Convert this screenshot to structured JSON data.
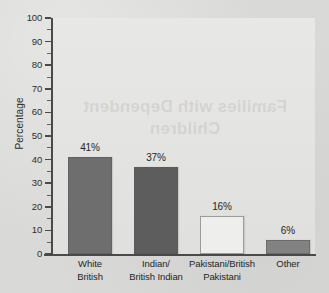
{
  "chart_data": {
    "type": "bar",
    "title": "",
    "subtitle": "",
    "xlabel": "",
    "ylabel": "Percentage",
    "ylim": [
      0,
      100
    ],
    "ytick_step": 10,
    "yticks": [
      0,
      10,
      20,
      30,
      40,
      50,
      60,
      70,
      80,
      90,
      100
    ],
    "minor_tick_step": 5,
    "grid": false,
    "legend": "none",
    "categories": [
      "White\nBritish",
      "Indian/\nBritish Indian",
      "Pakistani/British\nPakistani",
      "Other"
    ],
    "values": [
      41,
      37,
      16,
      6
    ],
    "data_labels": [
      "41%",
      "37%",
      "16%",
      "6%"
    ],
    "bar_colors": [
      "#6e6e6e",
      "#5d5d5d",
      "#eeeeec",
      "#828282"
    ]
  },
  "axes": {
    "y_title": "Percentage",
    "y_tick_labels": [
      "100",
      "90",
      "80",
      "70",
      "60",
      "50",
      "40",
      "30",
      "20",
      "10",
      "0"
    ]
  },
  "background": {
    "page_color": "#d9d9d7",
    "plot_color": "#dededc",
    "axis_color": "#4a4a4a",
    "watermark_text": "Families with Dependent\nChildren"
  }
}
